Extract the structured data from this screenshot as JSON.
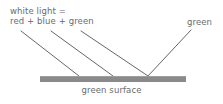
{
  "diagram": {
    "title_labels": {
      "incident_line1": "white light =",
      "incident_line2": "red + blue + green",
      "reflected": "green",
      "surface": "green surface"
    },
    "colors": {
      "background": "#ffffff",
      "text": "#6b6b6b",
      "ray_stroke": "#555555",
      "surface_fill": "#8a8a8a",
      "surface_top_edge": "#9e9e9e"
    },
    "surface": {
      "x": 40,
      "y": 76,
      "width": 146,
      "height": 6
    },
    "rays": {
      "incident": [
        {
          "name": "incident-ray-1",
          "x1": 21,
          "y1": 31,
          "x2": 79,
          "y2": 76
        },
        {
          "name": "incident-ray-2",
          "x1": 51,
          "y1": 31,
          "x2": 113,
          "y2": 76
        },
        {
          "name": "incident-ray-3",
          "x1": 81,
          "y1": 31,
          "x2": 148,
          "y2": 76
        }
      ],
      "reflected": [
        {
          "name": "reflected-ray-green",
          "x1": 148,
          "y1": 76,
          "x2": 191,
          "y2": 30
        }
      ]
    }
  }
}
